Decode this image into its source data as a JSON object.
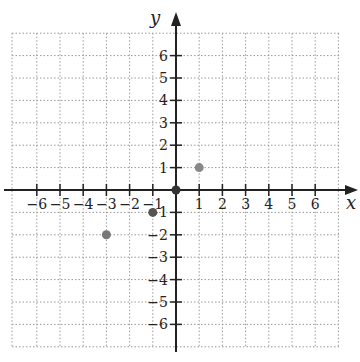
{
  "chart_data": {
    "type": "scatter",
    "title": "",
    "xlabel": "x",
    "ylabel": "y",
    "xlim": [
      -7,
      7
    ],
    "ylim": [
      -7,
      7
    ],
    "grid": true,
    "grid_style": "dotted",
    "x_ticks": [
      -6,
      -5,
      -4,
      -3,
      -2,
      -1,
      1,
      2,
      3,
      4,
      5,
      6
    ],
    "y_ticks": [
      -6,
      -5,
      -4,
      -3,
      -2,
      -1,
      1,
      2,
      3,
      4,
      5,
      6
    ],
    "x_tick_labels": [
      "−6",
      "−5",
      "−4",
      "−3",
      "−2",
      "−1",
      "1",
      "2",
      "3",
      "4",
      "5",
      "6"
    ],
    "y_tick_labels": [
      "−6",
      "−5",
      "−4",
      "−3",
      "−2",
      "−1",
      "1",
      "2",
      "3",
      "4",
      "5",
      "6"
    ],
    "series": [
      {
        "name": "points",
        "points": [
          {
            "x": 0,
            "y": 0,
            "color": "#333333"
          },
          {
            "x": 1,
            "y": 1,
            "color": "#888888"
          },
          {
            "x": -1,
            "y": -1,
            "color": "#555555"
          },
          {
            "x": -3,
            "y": -2,
            "color": "#777777"
          }
        ]
      }
    ]
  },
  "axes": {
    "x_label": "x",
    "y_label": "y"
  },
  "colors": {
    "axis": "#222222",
    "grid": "#9a9a9a"
  }
}
